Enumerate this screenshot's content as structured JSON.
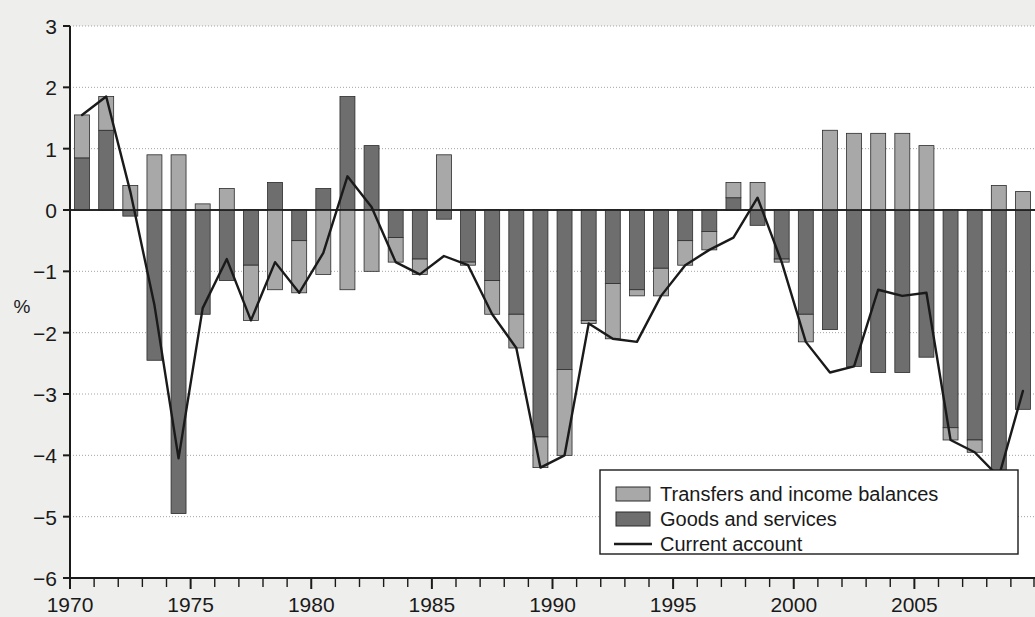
{
  "chart_data": {
    "type": "bar",
    "subtype": "stacked-bar-with-line",
    "title": "",
    "xlabel": "",
    "ylabel": "%",
    "ylim": [
      -6,
      3
    ],
    "yticks": [
      3,
      2,
      1,
      0,
      -1,
      -2,
      -3,
      -4,
      -5,
      -6
    ],
    "ytick_labels": [
      "3",
      "2",
      "1",
      "0",
      "−1",
      "−2",
      "−3",
      "−4",
      "−5",
      "−6"
    ],
    "xlim": [
      1970,
      2009
    ],
    "xticks": [
      1970,
      1975,
      1980,
      1985,
      1990,
      1995,
      2000,
      2005
    ],
    "xtick_labels": [
      "1970",
      "1975",
      "1980",
      "1985",
      "1990",
      "1995",
      "2000",
      "2005"
    ],
    "minor_xticks_every": 1,
    "grid": true,
    "grid_axis": "y",
    "legend_position": "bottom-right",
    "categories": [
      1970,
      1971,
      1972,
      1973,
      1974,
      1975,
      1976,
      1977,
      1978,
      1979,
      1980,
      1981,
      1982,
      1983,
      1984,
      1985,
      1986,
      1987,
      1988,
      1989,
      1990,
      1991,
      1992,
      1993,
      1994,
      1995,
      1996,
      1997,
      1998,
      1999,
      2000,
      2001,
      2002,
      2003,
      2004,
      2005,
      2006,
      2007,
      2008,
      2009
    ],
    "series": [
      {
        "name": "Goods and services",
        "color": "#6e6e6e",
        "values": [
          0.85,
          1.3,
          -0.1,
          -2.45,
          -4.95,
          -1.7,
          -1.15,
          -0.9,
          0.45,
          -0.5,
          0.35,
          1.85,
          1.05,
          -0.45,
          -0.8,
          -0.15,
          -0.85,
          -1.15,
          -1.7,
          -3.7,
          -2.6,
          -1.8,
          -1.2,
          -1.3,
          -0.95,
          -0.5,
          -0.35,
          0.2,
          -0.25,
          -0.8,
          -1.7,
          -1.95,
          -2.55,
          -2.65,
          -2.65,
          -2.4,
          -3.55,
          -3.75,
          -4.3,
          -3.25
        ]
      },
      {
        "name": "Transfers and income balances",
        "color": "#a8a8a8",
        "values": [
          0.7,
          0.55,
          0.4,
          0.9,
          0.9,
          0.1,
          0.35,
          -0.9,
          -1.3,
          -0.85,
          -1.05,
          -1.3,
          -1.0,
          -0.4,
          -0.25,
          0.9,
          -0.05,
          -0.55,
          -0.55,
          -0.5,
          -1.4,
          -0.05,
          -0.9,
          -0.1,
          -0.45,
          -0.4,
          -0.3,
          0.25,
          0.45,
          -0.05,
          -0.45,
          1.3,
          1.25,
          1.25,
          1.25,
          1.05,
          -0.2,
          -0.2,
          0.4,
          0.3
        ]
      }
    ],
    "line_series": {
      "name": "Current account",
      "color": "#1a1a1a",
      "values": [
        1.55,
        1.85,
        0.3,
        -1.55,
        -4.05,
        -1.6,
        -0.8,
        -1.8,
        -0.85,
        -1.35,
        -0.7,
        0.55,
        0.05,
        -0.85,
        -1.05,
        -0.75,
        -0.9,
        -1.7,
        -2.25,
        -4.2,
        -4.0,
        -1.85,
        -2.1,
        -2.15,
        -1.4,
        -0.9,
        -0.65,
        -0.45,
        0.2,
        -0.85,
        -2.15,
        -2.65,
        -2.55,
        -1.3,
        -1.4,
        -1.35,
        -3.75,
        -3.95,
        -4.35,
        -2.95
      ]
    }
  },
  "legend": {
    "items": [
      {
        "label": "Transfers and income balances",
        "type": "swatch",
        "color": "#a8a8a8"
      },
      {
        "label": "Goods and services",
        "type": "swatch",
        "color": "#6e6e6e"
      },
      {
        "label": "Current account",
        "type": "line",
        "color": "#1a1a1a"
      }
    ]
  },
  "colors": {
    "background": "#eeeeec",
    "plot_background": "#ffffff",
    "axis": "#1a1a1a",
    "grid": "#9a9a9a",
    "goods_and_services": "#6e6e6e",
    "transfers_and_income": "#a8a8a8",
    "current_account_line": "#1a1a1a"
  }
}
